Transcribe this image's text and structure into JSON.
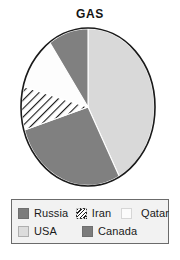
{
  "chart_data": {
    "type": "pie",
    "title": "GAS",
    "xlabel": "",
    "ylabel": "",
    "legend_position": "bottom",
    "grid": false,
    "start_angle_deg": 0,
    "direction": "clockwise",
    "categories": [
      "USA",
      "Russia",
      "Iran",
      "Qatar",
      "Canada"
    ],
    "values": [
      42,
      28,
      9,
      11,
      10
    ],
    "units": "percent",
    "slices": [
      {
        "label": "USA",
        "value": 42,
        "start_deg": 0,
        "end_deg": 152,
        "fill": "#d9d9d9",
        "pattern": "solid"
      },
      {
        "label": "Russia",
        "value": 28,
        "start_deg": 152,
        "end_deg": 253,
        "fill": "#808080",
        "pattern": "solid"
      },
      {
        "label": "Iran",
        "value": 9,
        "start_deg": 253,
        "end_deg": 285,
        "fill": "#ffffff",
        "pattern": "diagonal-hatch"
      },
      {
        "label": "Qatar",
        "value": 11,
        "start_deg": 285,
        "end_deg": 325,
        "fill": "#fdfdfd",
        "pattern": "solid"
      },
      {
        "label": "Canada",
        "value": 10,
        "start_deg": 325,
        "end_deg": 360,
        "fill": "#808080",
        "pattern": "solid"
      }
    ]
  },
  "title": "GAS",
  "legend": {
    "rows": [
      [
        {
          "label": "Russia",
          "swatch": "russia"
        },
        {
          "label": "Iran",
          "swatch": "iran"
        },
        {
          "label": "Qatar",
          "swatch": "qatar"
        }
      ],
      [
        {
          "label": "USA",
          "swatch": "usa"
        },
        {
          "label": "Canada",
          "swatch": "canada"
        }
      ]
    ]
  },
  "colors": {
    "dark_gray": "#808080",
    "light_gray": "#d9d9d9",
    "white": "#ffffff",
    "outline": "#1a1a1a",
    "legend_background": "#f2f2f2",
    "legend_border": "#6b6b6b"
  }
}
